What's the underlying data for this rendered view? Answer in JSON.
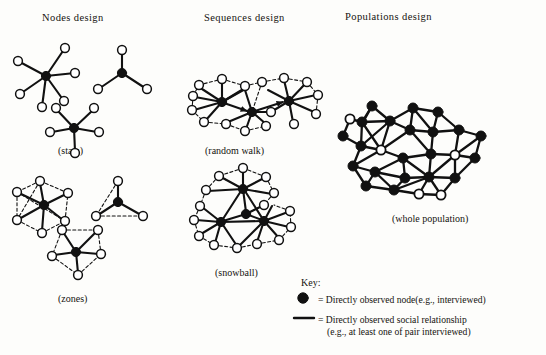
{
  "figure": {
    "width": 546,
    "height": 355,
    "background": "#fdfdfb",
    "ink": "#111111"
  },
  "columns": [
    {
      "id": "nodes",
      "title": "Nodes design",
      "x": 42,
      "y": 12
    },
    {
      "id": "sequences",
      "title": "Sequences design",
      "x": 204,
      "y": 12
    },
    {
      "id": "populations",
      "title": "Populations design",
      "x": 345,
      "y": 11
    }
  ],
  "captions": [
    {
      "id": "stars",
      "text": "(stars)",
      "x": 58,
      "y": 145
    },
    {
      "id": "zones",
      "text": "(zones)",
      "x": 58,
      "y": 293
    },
    {
      "id": "random-walk",
      "text": "(random walk)",
      "x": 205,
      "y": 145
    },
    {
      "id": "snowball",
      "text": "(snowball)",
      "x": 215,
      "y": 267
    },
    {
      "id": "whole-population",
      "text": "(whole population)",
      "x": 392,
      "y": 213
    }
  ],
  "key": {
    "title": "Key:",
    "title_x": 301,
    "title_y": 277,
    "entries": [
      {
        "id": "node",
        "symbol": "filled-circle",
        "lines": [
          "= Directly observed node(e.g., interviewed)"
        ]
      },
      {
        "id": "relationship",
        "symbol": "solid-line",
        "lines": [
          "= Directly observed social relationship",
          "(e.g., at least one of pair interviewed)"
        ]
      }
    ]
  },
  "legend_colors": {
    "observed_node_fill": "#111111",
    "unobserved_node_fill": "#ffffff",
    "edge_color": "#111111",
    "inferred_edge_style": "dashed"
  },
  "graphics": {
    "node_radius_small": 4.2,
    "node_radius_filled": 4.4,
    "solid_stroke": 2.1,
    "dashed_stroke": 1.1,
    "dash_pattern": "3,2.4"
  },
  "panels": {
    "stars": {
      "label": "stars",
      "figures": [
        {
          "id": "star-6",
          "center": [
            46,
            76
          ],
          "hub": "filled",
          "spokes": [
            [
              65,
              48
            ],
            [
              18,
              61
            ],
            [
              75,
              73
            ],
            [
              20,
              94
            ],
            [
              64,
              101
            ],
            [
              42,
              107
            ]
          ]
        },
        {
          "id": "star-3",
          "center": [
            122,
            73
          ],
          "hub": "filled",
          "spokes": [
            [
              122,
              50
            ],
            [
              98,
              89
            ],
            [
              146,
              88
            ]
          ]
        },
        {
          "id": "star-5",
          "center": [
            74,
            128
          ],
          "hub": "filled",
          "spokes": [
            [
              57,
              108
            ],
            [
              94,
              108
            ],
            [
              50,
              132
            ],
            [
              99,
              132
            ],
            [
              75,
              153
            ]
          ]
        }
      ]
    },
    "zones": {
      "label": "zones",
      "figures": [
        {
          "id": "zone-6",
          "center": [
            44,
            205
          ],
          "hub": "filled",
          "spokes": [
            [
              40,
              181
            ],
            [
              17,
              192
            ],
            [
              68,
              193
            ],
            [
              17,
              220
            ],
            [
              65,
              221
            ],
            [
              42,
              233
            ]
          ],
          "ring": true
        },
        {
          "id": "zone-3",
          "center": [
            118,
            202
          ],
          "hub": "filled",
          "spokes": [
            [
              118,
              181
            ],
            [
              96,
              216
            ],
            [
              143,
              216
            ]
          ],
          "ring": true
        },
        {
          "id": "zone-5",
          "center": [
            76,
            252
          ],
          "hub": "filled",
          "spokes": [
            [
              62,
              230
            ],
            [
              98,
              230
            ],
            [
              52,
              256
            ],
            [
              101,
              254
            ],
            [
              78,
              275
            ]
          ],
          "ring": true
        }
      ]
    },
    "random_walk": {
      "label": "random walk",
      "chain": [
        [
          222,
          102
        ],
        [
          252,
          112
        ],
        [
          289,
          101
        ]
      ],
      "arrows": [
        [
          222,
          102,
          252,
          112
        ],
        [
          252,
          112,
          289,
          101
        ]
      ]
    },
    "snowball": {
      "label": "snowball",
      "hubs": [
        [
          243,
          189
        ],
        [
          246,
          214
        ],
        [
          221,
          222
        ],
        [
          264,
          221
        ]
      ]
    },
    "whole_population": {
      "label": "whole population",
      "observed_count": 27,
      "unobserved_count": 6
    }
  }
}
